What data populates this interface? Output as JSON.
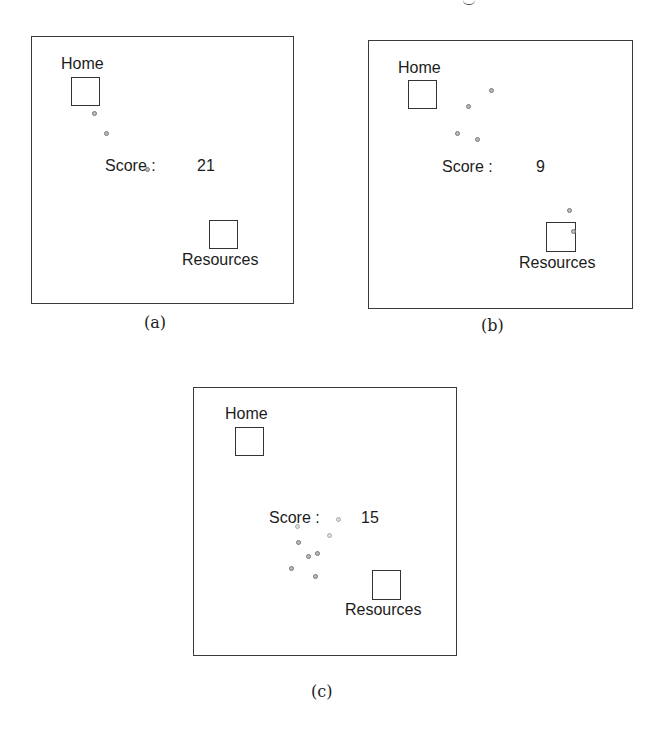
{
  "figure": {
    "panels": [
      {
        "id": "a",
        "caption": "(a)",
        "home_label": "Home",
        "resources_label": "Resources",
        "score_label": "Score :",
        "score_value": "21",
        "agent_count": 3
      },
      {
        "id": "b",
        "caption": "(b)",
        "home_label": "Home",
        "resources_label": "Resources",
        "score_label": "Score :",
        "score_value": "9",
        "agent_count": 6
      },
      {
        "id": "c",
        "caption": "(c)",
        "home_label": "Home",
        "resources_label": "Resources",
        "score_label": "Score :",
        "score_value": "15",
        "agent_count": 8
      }
    ]
  }
}
